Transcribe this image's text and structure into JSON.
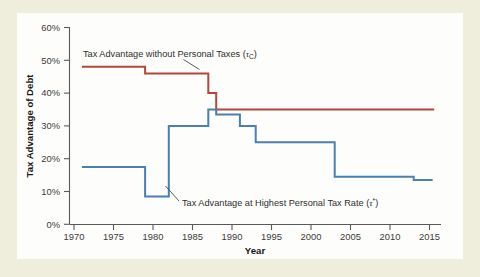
{
  "figure": {
    "background_color": "#efeddc",
    "panel_color": "#fdfdfb"
  },
  "chart_data": {
    "type": "line",
    "title": "",
    "subtitle": "",
    "xlabel": "Year",
    "ylabel": "Tax Advantage of Debt",
    "xlim": [
      1970,
      2017
    ],
    "ylim": [
      0,
      60
    ],
    "grid": false,
    "legend_position": "inline-annotations",
    "x_ticks": [
      1970,
      1975,
      1980,
      1985,
      1990,
      1995,
      2000,
      2005,
      2010,
      2015
    ],
    "x_tick_labels": [
      "1970",
      "1975",
      "1980",
      "1985",
      "1990",
      "1995",
      "2000",
      "2005",
      "2010",
      "2015"
    ],
    "y_ticks": [
      0,
      10,
      20,
      30,
      40,
      50,
      60
    ],
    "y_tick_labels": [
      "0%",
      "10%",
      "20%",
      "30%",
      "40%",
      "50%",
      "60%"
    ],
    "series": [
      {
        "name": "Tax Advantage without Personal Taxes (τc)",
        "color": "#b3473c",
        "step": "post",
        "x": [
          1971,
          1979,
          1979,
          1987,
          1987,
          1988,
          1988,
          2015.6
        ],
        "y": [
          48,
          48,
          46,
          46,
          40,
          40,
          35,
          35
        ],
        "values_by_year": [
          {
            "from": 1971,
            "to": 1979,
            "value": 48
          },
          {
            "from": 1979,
            "to": 1987,
            "value": 46
          },
          {
            "from": 1987,
            "to": 1988,
            "value": 40
          },
          {
            "from": 1988,
            "to": 2016,
            "value": 35
          }
        ]
      },
      {
        "name": "Tax Advantage at Highest Personal Tax Rate (τ*)",
        "color": "#4a7fb4",
        "step": "post",
        "x": [
          1971,
          1979,
          1979,
          1982,
          1982,
          1987,
          1987,
          1988,
          1988,
          1991,
          1991,
          1993,
          1993,
          2003,
          2003,
          2013,
          2013,
          2015.4
        ],
        "y": [
          17.5,
          17.5,
          8.5,
          8.5,
          30,
          30,
          35,
          35,
          33.5,
          33.5,
          30,
          30,
          25,
          25,
          14.5,
          14.5,
          13.5,
          13.5
        ],
        "values_by_year": [
          {
            "from": 1971,
            "to": 1979,
            "value": 17.5
          },
          {
            "from": 1979,
            "to": 1982,
            "value": 8.5
          },
          {
            "from": 1982,
            "to": 1987,
            "value": 30
          },
          {
            "from": 1987,
            "to": 1988,
            "value": 35
          },
          {
            "from": 1988,
            "to": 1991,
            "value": 33.5
          },
          {
            "from": 1991,
            "to": 1993,
            "value": 30
          },
          {
            "from": 1993,
            "to": 2003,
            "value": 25
          },
          {
            "from": 2003,
            "to": 2013,
            "value": 14.5
          },
          {
            "from": 2013,
            "to": 2016,
            "value": 13.5
          }
        ]
      }
    ],
    "annotations": [
      {
        "id": "annotation-tau-c",
        "text_prefix": "Tax Advantage without Personal Taxes (",
        "symbol": "τ",
        "subscript": "C",
        "text_suffix": ")",
        "target_series": "Tax Advantage without Personal Taxes (τc)"
      },
      {
        "id": "annotation-tau-star",
        "text_prefix": "Tax Advantage at Highest Personal Tax Rate (",
        "symbol": "τ",
        "subscript": "*",
        "text_suffix": ")",
        "target_series": "Tax Advantage at Highest Personal Tax Rate (τ*)"
      }
    ]
  }
}
